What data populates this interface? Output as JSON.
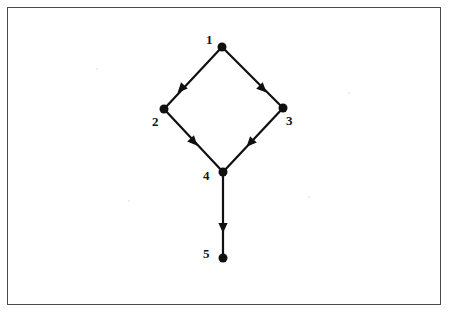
{
  "figure": {
    "border_color": "#4a4a4a",
    "background_color": "#ffffff",
    "ink_color": "#101010",
    "frame": {
      "x": 7,
      "y": 7,
      "width": 434,
      "height": 298
    }
  },
  "graph": {
    "type": "directed-graph",
    "node_radius": 4.5,
    "edge_width": 2.2,
    "nodes": [
      {
        "id": "1",
        "label": "1",
        "x": 222,
        "y": 47,
        "label_x": 206,
        "label_y": 33
      },
      {
        "id": "2",
        "label": "2",
        "x": 164,
        "y": 109,
        "label_x": 152,
        "label_y": 115
      },
      {
        "id": "3",
        "label": "3",
        "x": 283,
        "y": 108,
        "label_x": 286,
        "label_y": 114
      },
      {
        "id": "4",
        "label": "4",
        "x": 223,
        "y": 172,
        "label_x": 203,
        "label_y": 169
      },
      {
        "id": "5",
        "label": "5",
        "x": 223,
        "y": 258,
        "label_x": 203,
        "label_y": 247
      }
    ],
    "edges": [
      {
        "from": "1",
        "to": "2",
        "arrow_x": 181,
        "arrow_y": 89
      },
      {
        "from": "1",
        "to": "3",
        "arrow_x": 263,
        "arrow_y": 89
      },
      {
        "from": "2",
        "to": "4",
        "arrow_x": 194,
        "arrow_y": 142
      },
      {
        "from": "3",
        "to": "4",
        "arrow_x": 250,
        "arrow_y": 143
      },
      {
        "from": "4",
        "to": "5",
        "arrow_x": 223,
        "arrow_y": 228
      }
    ]
  }
}
